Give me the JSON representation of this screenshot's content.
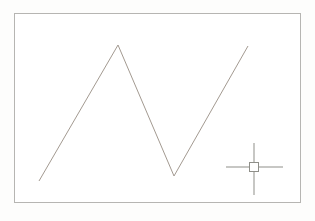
{
  "window": {
    "width": 315,
    "height": 221,
    "background": "#fdfdfc"
  },
  "drawing_area": {
    "frame": {
      "x": 14,
      "y": 13,
      "width": 287,
      "height": 190,
      "border_color": "#b6b5b2",
      "fill": "#ffffff"
    },
    "entities": [
      {
        "type": "polyline",
        "name": "zigzag-line",
        "color": "#a39a91",
        "stroke_width": 1,
        "points": [
          [
            39,
            181
          ],
          [
            118,
            45
          ],
          [
            174,
            176
          ],
          [
            248,
            46
          ]
        ]
      }
    ],
    "cursor": {
      "type": "crosshair-with-pickbox",
      "color": "#8f8f89",
      "center": {
        "x": 254,
        "y": 167
      },
      "horizontal_span": {
        "x1": 226,
        "x2": 283
      },
      "vertical_span": {
        "y1": 143,
        "y2": 195
      },
      "pickbox": {
        "size": 9,
        "fill": "#ffffff"
      }
    }
  }
}
